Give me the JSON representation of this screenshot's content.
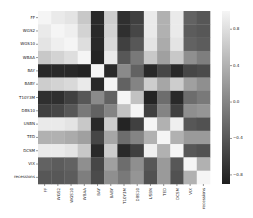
{
  "chart_data": {
    "type": "heatmap",
    "title": "",
    "xlabel": "",
    "ylabel": "",
    "labels": [
      "FF",
      "WGS2",
      "WGS10",
      "WBAA",
      "BAY",
      "BABY",
      "T10Y3M",
      "DBS10",
      "USBN",
      "TED",
      "DCSM",
      "VIX",
      "recessions"
    ],
    "matrix": [
      [
        1.0,
        0.9,
        0.85,
        0.6,
        -0.8,
        0.65,
        -0.75,
        -0.6,
        0.9,
        0.4,
        0.9,
        -0.3,
        -0.4
      ],
      [
        0.9,
        1.0,
        0.95,
        0.7,
        -0.8,
        0.7,
        -0.75,
        -0.55,
        0.9,
        0.4,
        0.9,
        -0.35,
        -0.4
      ],
      [
        0.85,
        0.95,
        1.0,
        0.8,
        -0.8,
        0.75,
        -0.6,
        -0.4,
        0.85,
        0.35,
        0.85,
        -0.3,
        -0.35
      ],
      [
        0.6,
        0.7,
        0.8,
        1.0,
        -0.85,
        0.9,
        -0.4,
        -0.1,
        0.6,
        0.25,
        0.6,
        0.1,
        -0.05
      ],
      [
        -0.8,
        -0.8,
        -0.8,
        -0.85,
        1.0,
        -0.8,
        0.05,
        -0.3,
        -0.8,
        -0.55,
        -0.8,
        -0.55,
        -0.5
      ],
      [
        0.65,
        0.7,
        0.75,
        0.9,
        -0.8,
        1.0,
        -0.3,
        0.0,
        0.65,
        0.3,
        0.65,
        0.25,
        0.1
      ],
      [
        -0.75,
        -0.75,
        -0.6,
        -0.4,
        0.05,
        -0.3,
        1.0,
        0.55,
        -0.85,
        -0.2,
        -0.8,
        -0.2,
        -0.1
      ],
      [
        -0.6,
        -0.55,
        -0.4,
        -0.1,
        -0.3,
        0.0,
        0.55,
        1.0,
        -0.6,
        0.0,
        -0.6,
        0.1,
        0.15
      ],
      [
        0.9,
        0.9,
        0.85,
        0.6,
        -0.8,
        0.65,
        -0.85,
        -0.6,
        1.0,
        0.4,
        0.95,
        -0.4,
        -0.45
      ],
      [
        0.4,
        0.4,
        0.35,
        0.25,
        -0.55,
        0.3,
        -0.2,
        0.0,
        0.4,
        1.0,
        0.4,
        0.2,
        0.2
      ],
      [
        0.9,
        0.9,
        0.85,
        0.6,
        -0.8,
        0.65,
        -0.8,
        -0.6,
        0.95,
        0.4,
        1.0,
        -0.4,
        -0.45
      ],
      [
        -0.3,
        -0.35,
        -0.3,
        0.1,
        -0.55,
        0.25,
        -0.2,
        0.1,
        -0.4,
        0.2,
        -0.4,
        1.0,
        0.4
      ],
      [
        -0.4,
        -0.4,
        -0.35,
        -0.05,
        -0.5,
        0.1,
        -0.1,
        0.15,
        -0.45,
        0.2,
        -0.45,
        0.4,
        1.0
      ]
    ],
    "colormap": "grayscale (dark = low, light = high)",
    "vmin": -0.9,
    "vmax": 1.0,
    "colorbar": {
      "ticks": [
        0.8,
        0.4,
        0.0,
        -0.4,
        -0.8
      ],
      "tick_labels": [
        "0.8",
        "0.4",
        "0.0",
        "−0.4",
        "−0.8"
      ],
      "position": "right"
    },
    "grid": false
  }
}
